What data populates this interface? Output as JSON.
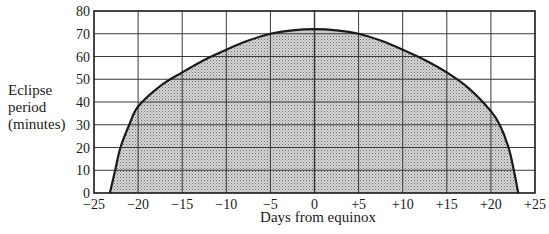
{
  "chart_data": {
    "type": "area",
    "title": "",
    "xlabel": "Days from equinox",
    "ylabel_lines": [
      "Eclipse",
      "period",
      "(minutes)"
    ],
    "xlim": [
      -25,
      25
    ],
    "ylim": [
      0,
      80
    ],
    "grid": true,
    "legend": null,
    "x_ticks": [
      -25,
      -20,
      -15,
      -10,
      -5,
      0,
      5,
      10,
      15,
      20,
      25
    ],
    "x_tick_labels": [
      "−25",
      "−20",
      "−15",
      "−10",
      "−5",
      "0",
      "+5",
      "+10",
      "+15",
      "+20",
      "+25"
    ],
    "y_ticks": [
      0,
      10,
      20,
      30,
      40,
      50,
      60,
      70,
      80
    ],
    "y_tick_labels": [
      "0",
      "10",
      "20",
      "30",
      "40",
      "50",
      "60",
      "70",
      "80"
    ],
    "fill": "stippled grey under curve",
    "series": [
      {
        "name": "Eclipse period",
        "x": [
          -23.2,
          -22.6,
          -22.0,
          -21.0,
          -20.0,
          -17.5,
          -15.0,
          -12.5,
          -10.0,
          -7.5,
          -5.0,
          -2.5,
          0.0,
          2.5,
          5.0,
          7.5,
          10.0,
          12.5,
          15.0,
          17.5,
          20.0,
          21.0,
          22.0,
          22.6,
          23.1
        ],
        "y": [
          0,
          10,
          20,
          30,
          38,
          47,
          53,
          58.5,
          63,
          67,
          70,
          71.5,
          72,
          71.5,
          70,
          67,
          63,
          58.5,
          53,
          46,
          36,
          30,
          20,
          10,
          0
        ]
      }
    ]
  },
  "colors": {
    "axis": "#1a1a1a",
    "grid": "#3a3a3a",
    "fill": "#c8c8c8",
    "stipple": "#7a7a7a",
    "background": "#ffffff"
  }
}
